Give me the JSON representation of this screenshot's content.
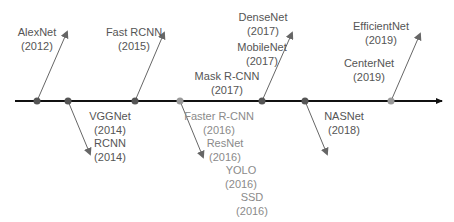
{
  "colors": {
    "axis": "#111111",
    "dark_text": "#555555",
    "light_text": "#8a8a8a",
    "dark_dot": "#555555",
    "light_dot": "#999999",
    "arrow": "#666666"
  },
  "timeline": {
    "nodes": [
      {
        "id": "n1",
        "x": 37,
        "tone": "dark",
        "direction": "up",
        "arrow_tip": [
          67,
          32
        ]
      },
      {
        "id": "n2",
        "x": 68,
        "tone": "dark",
        "direction": "down",
        "arrow_tip": [
          90,
          154
        ]
      },
      {
        "id": "n3",
        "x": 135,
        "tone": "dark",
        "direction": "up",
        "arrow_tip": [
          164,
          33
        ]
      },
      {
        "id": "n4",
        "x": 180,
        "tone": "light",
        "direction": "down",
        "arrow_tip": [
          203,
          157
        ]
      },
      {
        "id": "n5",
        "x": 262,
        "tone": "dark",
        "direction": "up",
        "arrow_tip": [
          292,
          33
        ]
      },
      {
        "id": "n6",
        "x": 305,
        "tone": "dark",
        "direction": "down",
        "arrow_tip": [
          327,
          154
        ]
      },
      {
        "id": "n7",
        "x": 391,
        "tone": "light",
        "direction": "up",
        "arrow_tip": [
          420,
          34
        ]
      }
    ]
  },
  "labels": [
    {
      "name": "AlexNet",
      "year": "(2012)",
      "x": 37,
      "y": 25,
      "tone": "dark"
    },
    {
      "name": "Fast RCNN",
      "year": "(2015)",
      "x": 134,
      "y": 25,
      "tone": "dark"
    },
    {
      "name": "DenseNet",
      "year": "(2017)",
      "x": 263,
      "y": 10,
      "tone": "dark"
    },
    {
      "name": "MobileNet",
      "year": "(2017)",
      "x": 262,
      "y": 40,
      "tone": "dark"
    },
    {
      "name": "Mask R-CNN",
      "year": "(2017)",
      "x": 227,
      "y": 69,
      "tone": "dark"
    },
    {
      "name": "EfficientNet",
      "year": "(2019)",
      "x": 381,
      "y": 19,
      "tone": "dark"
    },
    {
      "name": "CenterNet",
      "year": "(2019)",
      "x": 369,
      "y": 56,
      "tone": "dark"
    },
    {
      "name": "VGGNet",
      "year": "(2014)",
      "x": 110,
      "y": 109,
      "tone": "dark"
    },
    {
      "name": "RCNN",
      "year": "(2014)",
      "x": 110,
      "y": 136,
      "tone": "dark"
    },
    {
      "name": "Faster R-CNN",
      "year": "(2016)",
      "x": 219,
      "y": 109,
      "tone": "light"
    },
    {
      "name": "ResNet",
      "year": "(2016)",
      "x": 225,
      "y": 136,
      "tone": "light"
    },
    {
      "name": "YOLO",
      "year": "(2016)",
      "x": 241,
      "y": 163,
      "tone": "light"
    },
    {
      "name": "SSD",
      "year": "(2016)",
      "x": 252,
      "y": 190,
      "tone": "light"
    },
    {
      "name": "NASNet",
      "year": "(2018)",
      "x": 344,
      "y": 109,
      "tone": "dark"
    }
  ]
}
